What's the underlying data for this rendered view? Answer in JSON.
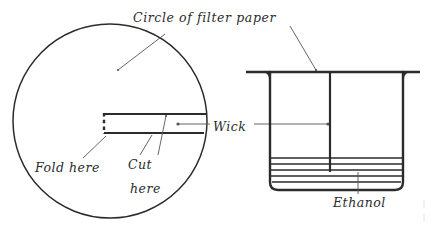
{
  "figure": {
    "ink_color": "#2b2b2b",
    "background_color": "#ffffff"
  },
  "labels": {
    "circle_of_filter_paper": "Circle of filter paper",
    "wick": "Wick",
    "fold_here": "Fold here",
    "cut_here_line1": "Cut",
    "cut_here_line2": "here",
    "ethanol": "Ethanol"
  },
  "parts": {
    "filter_paper_circle": "circle-of-filter-paper",
    "wick_slot": "wick-slot",
    "fold_line": "dashed-fold-line",
    "cut_edges": "cut-edges",
    "beaker": "beaker",
    "paper_on_beaker": "filter-paper-lid",
    "hanging_wick": "hanging-wick",
    "ethanol_liquid": "ethanol-liquid-lines"
  },
  "geometry": {
    "circle": {
      "cx": 110,
      "cy": 121,
      "r": 97
    },
    "slot": {
      "x_left": 104,
      "x_right": 205,
      "y_top": 114,
      "y_bottom": 133
    },
    "beaker": {
      "x_left": 270,
      "x_right": 403,
      "y_top": 72,
      "y_bottom": 190
    },
    "paper_lid": {
      "x_left": 246,
      "x_right": 420,
      "y": 72
    },
    "wick": {
      "x": 330,
      "y_top": 72,
      "y_bottom": 172
    },
    "ethanol_lines": 5,
    "ethanol_top_y": 158
  }
}
